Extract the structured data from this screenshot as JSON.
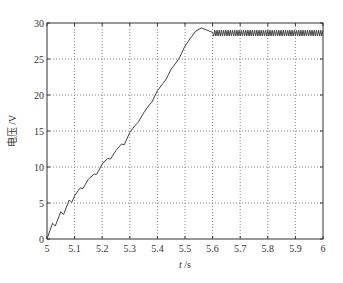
{
  "chart_data": {
    "type": "line",
    "title": "",
    "xlabel": "t /s",
    "xlabel_var": "t",
    "xlabel_unit": " /s",
    "ylabel": "电压 /V",
    "xlim": [
      5,
      6
    ],
    "ylim": [
      0,
      30
    ],
    "grid": true,
    "grid_style": "dotted",
    "legend": null,
    "x_ticks": [
      "5",
      "5.1",
      "5.2",
      "5.3",
      "5.4",
      "5.5",
      "5.6",
      "5.7",
      "5.8",
      "5.9",
      "6"
    ],
    "y_ticks": [
      "0",
      "5",
      "10",
      "15",
      "20",
      "25",
      "30"
    ],
    "series": [
      {
        "name": "voltage",
        "color": "#444444",
        "description": "Near-linear ramp with small sawtooth steps from 0 V at t=5 s to ~29.3 V peak near t=5.52 s, then settles to ~28.6 V with high-frequency ripple (~±0.4 V) through t=6 s",
        "x": [
          5.0,
          5.02,
          5.03,
          5.05,
          5.06,
          5.08,
          5.09,
          5.1,
          5.12,
          5.13,
          5.15,
          5.17,
          5.18,
          5.2,
          5.22,
          5.23,
          5.25,
          5.27,
          5.28,
          5.3,
          5.32,
          5.33,
          5.35,
          5.37,
          5.38,
          5.4,
          5.42,
          5.43,
          5.45,
          5.47,
          5.48,
          5.5,
          5.52,
          5.54,
          5.56,
          5.58,
          5.6,
          5.62,
          5.65,
          5.7,
          5.75,
          5.8,
          5.85,
          5.9,
          5.95,
          6.0
        ],
        "y": [
          0.0,
          2.2,
          1.8,
          3.8,
          3.4,
          5.4,
          5.1,
          6.0,
          7.1,
          7.0,
          8.3,
          9.0,
          9.0,
          10.4,
          11.2,
          11.1,
          12.3,
          13.2,
          13.1,
          14.8,
          15.8,
          16.2,
          17.5,
          18.6,
          19.0,
          20.6,
          21.6,
          22.1,
          23.6,
          24.6,
          25.2,
          26.8,
          27.9,
          28.9,
          29.3,
          29.0,
          28.7,
          28.6,
          28.6,
          28.6,
          28.6,
          28.6,
          28.6,
          28.6,
          28.6,
          28.6
        ],
        "steady_state": 28.6,
        "ripple_amplitude": 0.4,
        "peak": 29.3
      }
    ]
  }
}
